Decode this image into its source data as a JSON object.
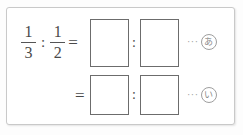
{
  "worksheet": {
    "kind": "math-ratio-exercise",
    "frame_border_color": "#c9c9c9",
    "box_border_color": "#6c6c6c",
    "text_color": "#4a4a4a"
  },
  "problem": {
    "left_fraction": {
      "numerator": "1",
      "denominator": "3"
    },
    "ratio_separator": ":",
    "right_fraction": {
      "numerator": "1",
      "denominator": "2"
    },
    "equals": "="
  },
  "row1": {
    "answer_box_1": "",
    "separator": ":",
    "answer_box_2": "",
    "leader_dots": "···",
    "label": "あ"
  },
  "row2": {
    "equals": "=",
    "answer_box_1": "",
    "separator": ":",
    "answer_box_2": "",
    "leader_dots": "···",
    "label": "い"
  }
}
